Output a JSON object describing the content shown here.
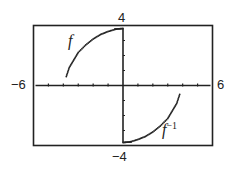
{
  "chart_data": {
    "type": "scatter",
    "title": "",
    "xlabel": "",
    "ylabel": "",
    "xlim": [
      -6,
      6
    ],
    "ylim": [
      -4,
      4
    ],
    "grid": false,
    "axis_labels": {
      "xmin": "−6",
      "xmax": "6",
      "ymax": "4",
      "ymin": "−4"
    },
    "series": [
      {
        "name": "f",
        "label": "f",
        "points": [
          [
            -3.8,
            0.6
          ],
          [
            -3.6,
            1.2
          ],
          [
            -3.3,
            1.7
          ],
          [
            -3.0,
            2.2
          ],
          [
            -2.5,
            2.7
          ],
          [
            -2.0,
            3.1
          ],
          [
            -1.5,
            3.4
          ],
          [
            -1.0,
            3.6
          ],
          [
            -0.5,
            3.75
          ],
          [
            0,
            3.8
          ]
        ],
        "vertical_segment": [
          [
            0,
            3.8
          ],
          [
            0,
            0
          ]
        ]
      },
      {
        "name": "f^-1",
        "label": "f",
        "label_sup": "−1",
        "points": [
          [
            0,
            -3.8
          ],
          [
            0.5,
            -3.75
          ],
          [
            1.0,
            -3.6
          ],
          [
            1.5,
            -3.4
          ],
          [
            2.0,
            -3.1
          ],
          [
            2.5,
            -2.7
          ],
          [
            3.0,
            -2.2
          ],
          [
            3.3,
            -1.7
          ],
          [
            3.6,
            -1.2
          ],
          [
            3.8,
            -0.6
          ]
        ],
        "vertical_segment": [
          [
            0,
            0
          ],
          [
            0,
            -3.8
          ]
        ]
      }
    ]
  }
}
